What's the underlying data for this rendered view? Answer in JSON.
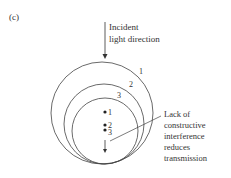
{
  "panel_label": "(c)",
  "incident": {
    "line1": "Incident",
    "line2": "light direction"
  },
  "circles": [
    {
      "label": "1",
      "cx": 102,
      "cy": 113,
      "r": 51
    },
    {
      "label": "2",
      "cx": 104,
      "cy": 124,
      "r": 40
    },
    {
      "label": "3",
      "cx": 105,
      "cy": 131,
      "r": 33
    }
  ],
  "points": [
    {
      "label": "1",
      "x": 105,
      "y": 112
    },
    {
      "label": "2",
      "x": 105,
      "y": 125
    },
    {
      "label": "3",
      "x": 105,
      "y": 130
    }
  ],
  "annotation": {
    "lines": [
      "Lack of",
      "constructive",
      "interference",
      "reduces",
      "transmission"
    ]
  },
  "colors": {
    "stroke": "#333333",
    "background": "#ffffff"
  }
}
